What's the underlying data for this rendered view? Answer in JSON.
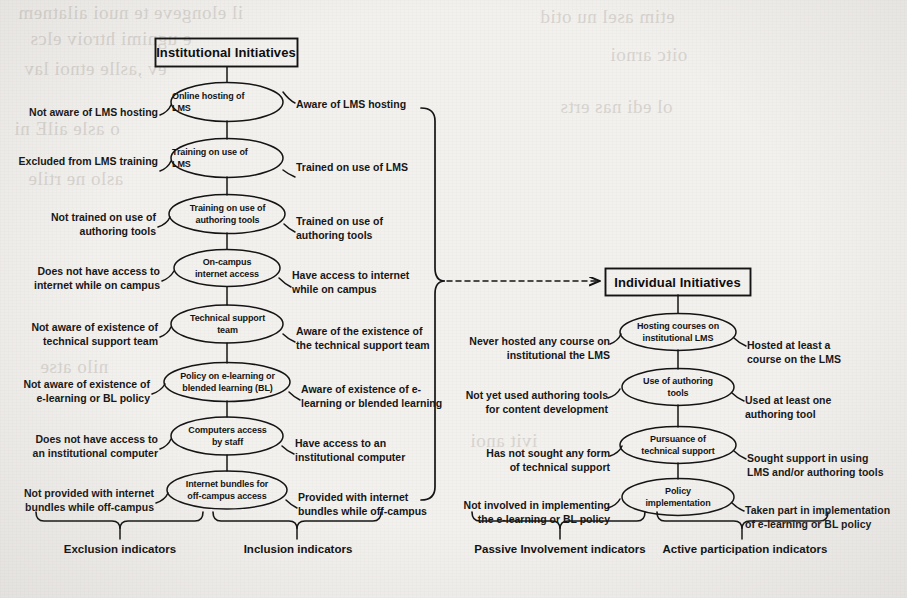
{
  "figure": {
    "background_color": "#f3f1ee",
    "ink_color": "#141414"
  },
  "institutional": {
    "title": "Institutional Initiatives",
    "nodes": [
      {
        "node": "Online hosting of\nLMS",
        "exclusion": "Not aware of LMS hosting",
        "inclusion": "Aware of LMS hosting"
      },
      {
        "node": "Training on use of\nLMS",
        "exclusion": "Excluded from LMS training",
        "inclusion": "Trained on use of LMS"
      },
      {
        "node": "Training on use of\nauthoring tools",
        "exclusion": "Not trained on use of\nauthoring tools",
        "inclusion": "Trained on use of\nauthoring tools"
      },
      {
        "node": "On-campus\ninternet access",
        "exclusion": "Does not have access to\ninternet while on campus",
        "inclusion": "Have access to internet\nwhile on campus"
      },
      {
        "node": "Technical support\nteam",
        "exclusion": "Not aware of existence of\ntechnical support team",
        "inclusion": "Aware of the existence of\nthe technical support team"
      },
      {
        "node": "Policy on e-learning or\nblended learning (BL)",
        "exclusion": "Not aware of existence of\ne-learning or BL policy",
        "inclusion": "Aware of existence of e-\nlearning or blended learning"
      },
      {
        "node": "Computers access\nby staff",
        "exclusion": "Does not have access to\nan institutional computer",
        "inclusion": "Have access to an\ninstitutional computer"
      },
      {
        "node": "Internet bundles for\noff-campus access",
        "exclusion": "Not provided with internet\nbundles while off-campus",
        "inclusion": "Provided with internet\nbundles while off-campus"
      }
    ],
    "group_left_label": "Exclusion indicators",
    "group_right_label": "Inclusion indicators"
  },
  "individual": {
    "title": "Individual Initiatives",
    "nodes": [
      {
        "node": "Hosting courses on\ninstitutional LMS",
        "passive": "Never hosted any course on\ninstitutional the LMS",
        "active": "Hosted at least a\ncourse on the LMS"
      },
      {
        "node": "Use of authoring\ntools",
        "passive": "Not yet used authoring tools\nfor content development",
        "active": "Used at least one\nauthoring tool"
      },
      {
        "node": "Pursuance of\ntechnical support",
        "passive": "Has not sought any form\nof technical support",
        "active": "Sought support in using\nLMS and/or authoring tools"
      },
      {
        "node": "Policy\nimplementation",
        "passive": "Not involved in implementing\nthe e-learning or BL policy",
        "active": "Taken part in implementation\nof e-learning or BL policy"
      }
    ],
    "group_left_label": "Passive Involvement indicators",
    "group_right_label": "Active participation indicators"
  },
  "connector": {
    "style": "dashed-arrow",
    "from": "institutional-group-bracket",
    "to": "individual-initiatives-box"
  },
  "bleed_through": [
    "il elongeve te",
    "e ugnimi",
    "he",
    "o asle ailE",
    "atl",
    "eno",
    "etim",
    "rai",
    "oitc",
    "ol",
    "edi",
    "nas"
  ]
}
